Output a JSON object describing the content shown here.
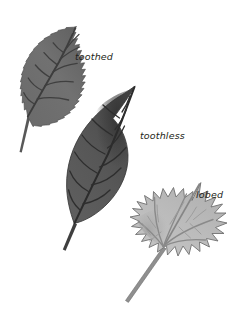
{
  "figure": {
    "background_color": "#ffffff",
    "width": 252,
    "height": 323
  },
  "labels": {
    "toothed": "toothed",
    "toothless": "toothless",
    "lobed": "lobed"
  },
  "leaves": [
    {
      "id": "toothed-leaf",
      "label": "toothed",
      "margin_type": "toothed",
      "description": "elongate leaf with serrated (toothed) margin, pinnate venation, oriented up-right",
      "fill_color": "#6e6e6e",
      "vein_color": "#3f3f3f",
      "outline_color": "#4a4a4a",
      "position": {
        "x": 12,
        "y": 22,
        "width": 80,
        "height": 140
      }
    },
    {
      "id": "toothless-leaf",
      "label": "toothless",
      "margin_type": "toothless",
      "description": "elliptic leaf with smooth (entire) margin, pinnate venation, dark shading, oriented up-right",
      "fill_color": "#5a5a5a",
      "shade_color": "#3a3a3a",
      "vein_color": "#2e2e2e",
      "outline_color": "#3a3a3a",
      "position": {
        "x": 58,
        "y": 82,
        "width": 90,
        "height": 170
      }
    },
    {
      "id": "lobed-leaf",
      "label": "lobed",
      "margin_type": "lobed",
      "description": "maple-like leaf with deeply lobed margin, palmate venation, light gray, oriented up-right",
      "fill_color": "#bdbdbd",
      "shade_color": "#9c9c9c",
      "vein_color": "#8a8a8a",
      "outline_color": "#757575",
      "position": {
        "x": 118,
        "y": 180,
        "width": 110,
        "height": 130
      }
    }
  ],
  "colors": {
    "background": "#ffffff",
    "label_text": "#231f20",
    "dark_leaf": "#5a5a5a",
    "mid_leaf": "#6e6e6e",
    "light_leaf": "#bdbdbd"
  }
}
